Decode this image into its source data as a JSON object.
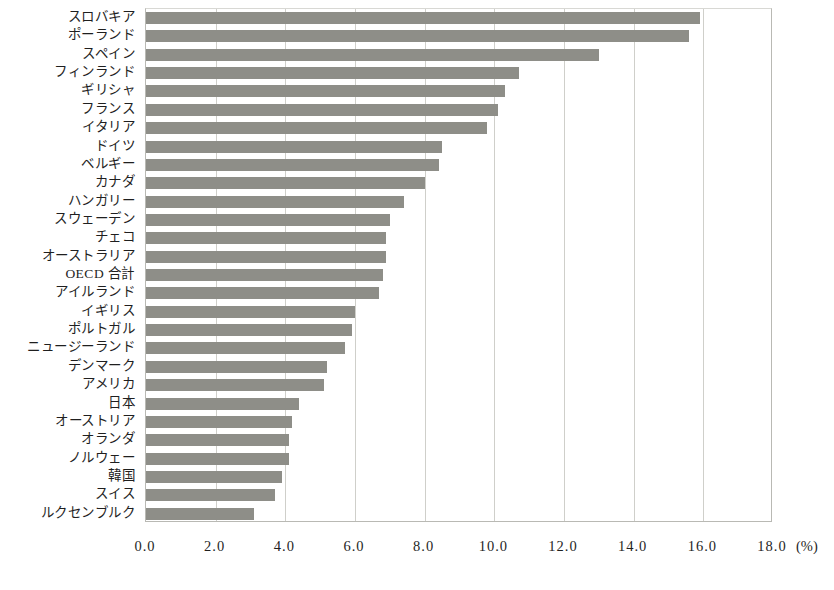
{
  "chart_data": {
    "type": "bar",
    "orientation": "horizontal",
    "title": "",
    "xlabel": "(%)",
    "ylabel": "",
    "xlim": [
      0.0,
      18.0
    ],
    "xticks": [
      "0.0",
      "2.0",
      "4.0",
      "6.0",
      "8.0",
      "10.0",
      "12.0",
      "14.0",
      "16.0",
      "18.0"
    ],
    "xtick_values": [
      0,
      2,
      4,
      6,
      8,
      10,
      12,
      14,
      16,
      18
    ],
    "unit_label": "(%)",
    "grid": "vertical",
    "legend": "none",
    "bar_color": "#8e8e88",
    "categories": [
      "スロバキア",
      "ポーランド",
      "スペイン",
      "フィンランド",
      "ギリシャ",
      "フランス",
      "イタリア",
      "ドイツ",
      "ベルギー",
      "カナダ",
      "ハンガリー",
      "スウェーデン",
      "チェコ",
      "オーストラリア",
      "OECD 合計",
      "アイルランド",
      "イギリス",
      "ポルトガル",
      "ニュージーランド",
      "デンマーク",
      "アメリカ",
      "日本",
      "オーストリア",
      "オランダ",
      "ノルウェー",
      "韓国",
      "スイス",
      "ルクセンブルク"
    ],
    "values": [
      15.9,
      15.6,
      13.0,
      10.7,
      10.3,
      10.1,
      9.8,
      8.5,
      8.4,
      8.0,
      7.4,
      7.0,
      6.9,
      6.9,
      6.8,
      6.7,
      6.0,
      5.9,
      5.7,
      5.2,
      5.1,
      4.4,
      4.2,
      4.1,
      4.1,
      3.9,
      3.7,
      3.1
    ]
  }
}
